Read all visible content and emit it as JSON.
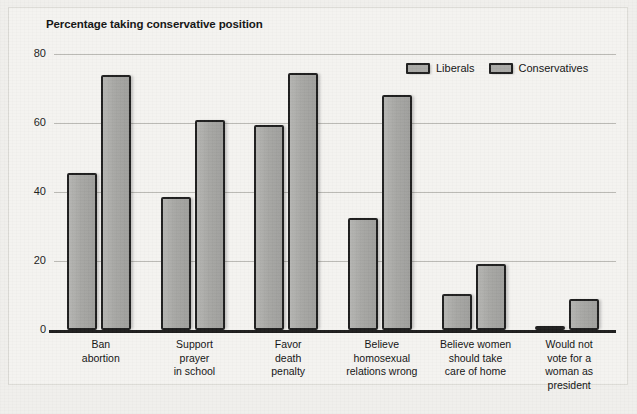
{
  "chart_data": {
    "type": "bar",
    "title": "Percentage taking conservative position",
    "xlabel": "",
    "ylabel": "",
    "ylim": [
      0,
      80
    ],
    "yticks": [
      0,
      20,
      40,
      60,
      80
    ],
    "grid": true,
    "legend_position": "top-right",
    "categories": [
      "Ban abortion",
      "Support prayer in school",
      "Favor death penalty",
      "Believe homosexual relations wrong",
      "Believe women should take care of home",
      "Would not vote for a woman as president"
    ],
    "category_lines": [
      [
        "Ban",
        "abortion"
      ],
      [
        "Support",
        "prayer",
        "in school"
      ],
      [
        "Favor",
        "death",
        "penalty"
      ],
      [
        "Believe",
        "homosexual",
        "relations wrong"
      ],
      [
        "Believe women",
        "should take",
        "care of home"
      ],
      [
        "Would not",
        "vote for a",
        "woman as",
        "president"
      ]
    ],
    "series": [
      {
        "name": "Liberals",
        "values": [
          45.5,
          38.5,
          59.5,
          32.5,
          10.5,
          1.0
        ]
      },
      {
        "name": "Conservatives",
        "values": [
          74.0,
          61.0,
          74.5,
          68.0,
          19.0,
          9.0
        ]
      }
    ]
  },
  "legend": {
    "items": [
      {
        "label": "Liberals"
      },
      {
        "label": "Conservatives"
      }
    ]
  },
  "axis": {
    "y_tick_labels": [
      "80",
      "60",
      "40",
      "20",
      "0"
    ]
  }
}
